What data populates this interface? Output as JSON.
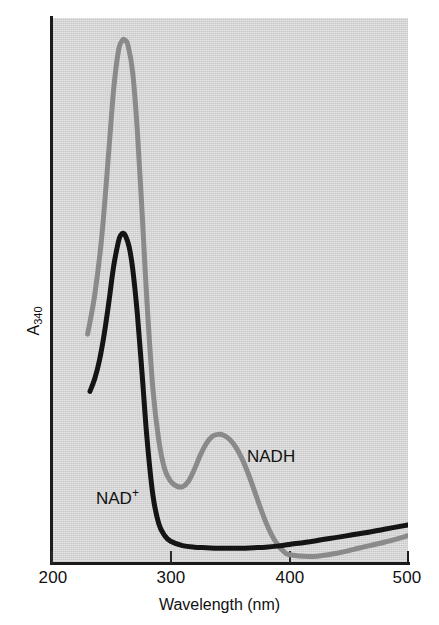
{
  "figure": {
    "background_color": "#d6d6d6",
    "axis_color": "#1b1b1b"
  },
  "axes": {
    "x_title": "Wavelength (nm)",
    "y_title_base": "A",
    "y_title_sub": "340",
    "x_ticks": [
      "200",
      "300",
      "400",
      "500"
    ]
  },
  "annotations": {
    "nad_plus_base": "NAD",
    "nad_plus_sup": "+",
    "nadh": "NADH"
  },
  "chart_data": {
    "type": "line",
    "title": "",
    "xlabel": "Wavelength (nm)",
    "ylabel": "A340",
    "xlim": [
      200,
      500
    ],
    "ylim": [
      0,
      1.0
    ],
    "grid": false,
    "legend": "inline-annotations",
    "xtick_labels": [
      "200",
      "300",
      "400",
      "500"
    ],
    "xticks": [
      200,
      300,
      400,
      500
    ],
    "yticks": [],
    "series": [
      {
        "name": "NAD+",
        "color": "#141414",
        "annotation": "NAD+",
        "annotation_x": 245,
        "annotation_y": 0.13,
        "peak_x": 260,
        "peak_y": 0.605,
        "x": [
          232,
          236,
          240,
          244,
          248,
          252,
          256,
          258,
          260,
          262,
          265,
          268,
          272,
          276,
          280,
          285,
          290,
          295,
          300,
          310,
          320,
          330,
          340,
          350,
          360,
          370,
          380,
          390,
          400,
          420,
          440,
          460,
          480,
          500
        ],
        "y": [
          0.315,
          0.338,
          0.372,
          0.42,
          0.48,
          0.545,
          0.59,
          0.602,
          0.605,
          0.6,
          0.58,
          0.54,
          0.455,
          0.345,
          0.23,
          0.125,
          0.072,
          0.05,
          0.04,
          0.032,
          0.029,
          0.028,
          0.027,
          0.027,
          0.027,
          0.028,
          0.029,
          0.031,
          0.034,
          0.04,
          0.047,
          0.054,
          0.062,
          0.07
        ]
      },
      {
        "name": "NADH",
        "color": "#8a8a8a",
        "annotation": "NADH",
        "annotation_x": 365,
        "annotation_y": 0.215,
        "peak_x": 260,
        "peak_y": 0.96,
        "secondary_peak_x": 340,
        "secondary_peak_y": 0.236,
        "trough_x": 310,
        "trough_y": 0.14,
        "x": [
          230,
          236,
          242,
          248,
          252,
          256,
          259,
          261,
          264,
          268,
          272,
          276,
          280,
          285,
          290,
          295,
          300,
          305,
          310,
          315,
          320,
          325,
          330,
          335,
          340,
          345,
          350,
          355,
          360,
          365,
          370,
          375,
          380,
          385,
          390,
          395,
          400,
          420,
          440,
          460,
          480,
          500
        ],
        "y": [
          0.42,
          0.492,
          0.6,
          0.76,
          0.87,
          0.94,
          0.958,
          0.96,
          0.95,
          0.9,
          0.79,
          0.64,
          0.48,
          0.32,
          0.225,
          0.172,
          0.15,
          0.141,
          0.14,
          0.15,
          0.172,
          0.198,
          0.219,
          0.232,
          0.236,
          0.234,
          0.226,
          0.212,
          0.192,
          0.166,
          0.136,
          0.105,
          0.076,
          0.052,
          0.034,
          0.022,
          0.015,
          0.012,
          0.018,
          0.028,
          0.038,
          0.05
        ]
      }
    ]
  }
}
